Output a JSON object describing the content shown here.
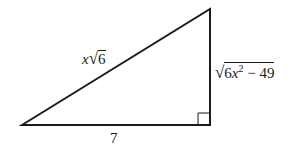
{
  "diagram": {
    "type": "right-triangle",
    "line_color": "#1a1a1a",
    "vertices": {
      "left": [
        22,
        125
      ],
      "top_right": [
        210,
        9
      ],
      "bottom_right": [
        210,
        125
      ]
    },
    "labels": {
      "hypotenuse": {
        "var": "x",
        "radicand": "6"
      },
      "vertical_leg": {
        "radicand_a": "6",
        "var": "x",
        "exp": "2",
        "rest": " − 49"
      },
      "base": "7"
    },
    "right_angle_marker": true
  }
}
